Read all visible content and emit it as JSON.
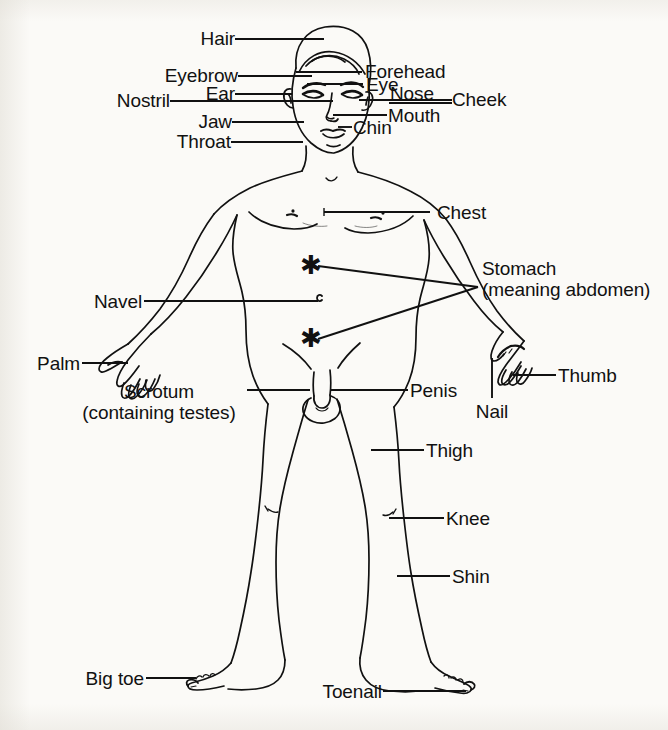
{
  "diagram": {
    "background_color": "#fbfaf7",
    "ink_color": "#111111",
    "marker_glyph": "asterisk"
  },
  "labels": {
    "hair": "Hair",
    "forehead": "Forehead",
    "eyebrow": "Eyebrow",
    "eye": "Eye",
    "nose": "Nose",
    "ear": "Ear",
    "cheek": "Cheek",
    "nostril": "Nostril",
    "mouth": "Mouth",
    "jaw": "Jaw",
    "chin": "Chin",
    "throat": "Throat",
    "chest": "Chest",
    "stomach_line1": "Stomach",
    "stomach_line2": "(meaning abdomen)",
    "navel": "Navel",
    "palm": "Palm",
    "thumb": "Thumb",
    "nail": "Nail",
    "scrotum_line1": "Scrotum",
    "scrotum_line2": "(containing testes)",
    "penis": "Penis",
    "thigh": "Thigh",
    "knee": "Knee",
    "shin": "Shin",
    "big_toe": "Big toe",
    "toenail": "Toenail"
  }
}
